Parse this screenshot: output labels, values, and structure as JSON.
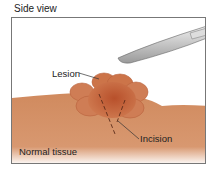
{
  "title": "Side view",
  "labels": {
    "lesion": "Lesion",
    "incision": "Incision",
    "normal_tissue": "Normal tissue"
  },
  "colors": {
    "tissue": "#d49066",
    "tissue_dark": "#c77a52",
    "lesion": "#c9683f",
    "lesion_center": "#b9502c",
    "scalpel": "#c8c8c8",
    "frame": "#777777"
  }
}
